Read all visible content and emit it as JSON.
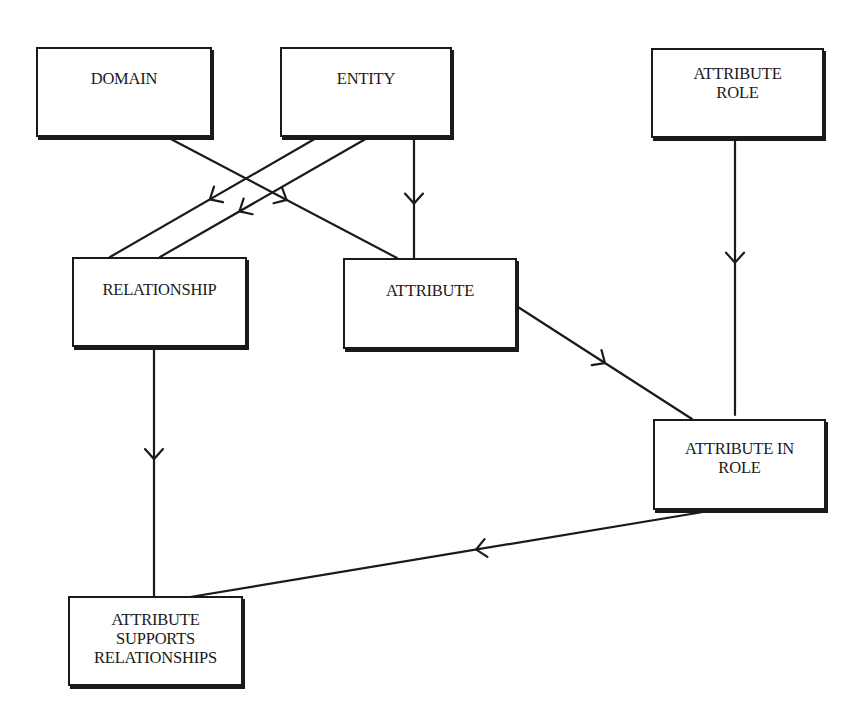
{
  "diagram": {
    "colors": {
      "stroke": "#1a1a1a",
      "background": "#ffffff"
    },
    "nodes": [
      {
        "id": "domain",
        "label": "DOMAIN",
        "x": 36,
        "y": 47,
        "w": 176,
        "h": 90,
        "pad_top": 20
      },
      {
        "id": "entity",
        "label": "ENTITY",
        "x": 280,
        "y": 47,
        "w": 172,
        "h": 90,
        "pad_top": 20
      },
      {
        "id": "attribute_role",
        "label": "ATTRIBUTE\nROLE",
        "x": 651,
        "y": 48,
        "w": 173,
        "h": 90,
        "pad_top": 14
      },
      {
        "id": "relationship",
        "label": "RELATIONSHIP",
        "x": 72,
        "y": 257,
        "w": 175,
        "h": 90,
        "pad_top": 21
      },
      {
        "id": "attribute",
        "label": "ATTRIBUTE",
        "x": 343,
        "y": 258,
        "w": 174,
        "h": 91,
        "pad_top": 21
      },
      {
        "id": "attribute_in_role",
        "label": "ATTRIBUTE IN\nROLE",
        "x": 653,
        "y": 419,
        "w": 173,
        "h": 91,
        "pad_top": 18
      },
      {
        "id": "attribute_supports_relationships",
        "label": "ATTRIBUTE\nSUPPORTS\nRELATIONSHIPS",
        "x": 68,
        "y": 596,
        "w": 175,
        "h": 90,
        "pad_top": 12
      }
    ],
    "edges": [
      {
        "id": "domain-to-attribute",
        "from": "domain",
        "to": "attribute",
        "x1": 167,
        "y1": 137,
        "x2": 397,
        "y2": 258,
        "arrow_t": 0.52
      },
      {
        "id": "entity-to-relationship-1",
        "from": "entity",
        "to": "relationship",
        "x1": 318,
        "y1": 137,
        "x2": 110,
        "y2": 257,
        "arrow_t": 0.52
      },
      {
        "id": "entity-to-relationship-2",
        "from": "entity",
        "to": "relationship",
        "x1": 369,
        "y1": 137,
        "x2": 160,
        "y2": 257,
        "arrow_t": 0.62
      },
      {
        "id": "entity-to-attribute",
        "from": "entity",
        "to": "attribute",
        "x1": 414,
        "y1": 137,
        "x2": 414,
        "y2": 258,
        "arrow_t": 0.55
      },
      {
        "id": "attribute-role-to-attribute-in-role",
        "from": "attribute_role",
        "to": "attribute_in_role",
        "x1": 735,
        "y1": 138,
        "x2": 735,
        "y2": 415,
        "arrow_t": 0.45
      },
      {
        "id": "attribute-to-attribute-in-role",
        "from": "attribute",
        "to": "attribute_in_role",
        "x1": 518,
        "y1": 307,
        "x2": 692,
        "y2": 419,
        "arrow_t": 0.5
      },
      {
        "id": "relationship-to-attribute-supports-relationships",
        "from": "relationship",
        "to": "attribute_supports_relationships",
        "x1": 154,
        "y1": 347,
        "x2": 154,
        "y2": 596,
        "arrow_t": 0.45
      },
      {
        "id": "attribute-in-role-to-attribute-supports-relationships",
        "from": "attribute_in_role",
        "to": "attribute_supports_relationships",
        "x1": 715,
        "y1": 510,
        "x2": 190,
        "y2": 597,
        "arrow_t": 0.455
      }
    ]
  }
}
